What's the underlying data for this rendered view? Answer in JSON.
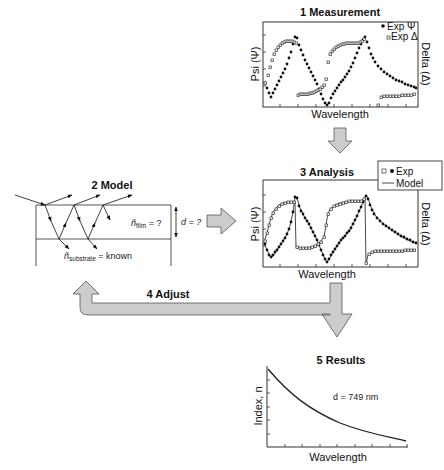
{
  "diagram": {
    "steps": [
      {
        "id": "measurement",
        "label": "1 Measurement"
      },
      {
        "id": "model",
        "label": "2 Model"
      },
      {
        "id": "analysis",
        "label": "3 Analysis"
      },
      {
        "id": "adjust",
        "label": "4 Adjust"
      },
      {
        "id": "results",
        "label": "5 Results"
      }
    ],
    "measurement": {
      "xlabel": "Wavelength",
      "ylabel_left": "Psi (Ψ)",
      "ylabel_right": "Delta (Δ)",
      "legend": [
        {
          "marker": "filled-circle",
          "label": "Exp Ψ"
        },
        {
          "marker": "open-square",
          "label": "Exp Δ"
        }
      ]
    },
    "model": {
      "film_label": "ñ",
      "film_sub": "film",
      "film_value": " = ?",
      "thickness_label": "d = ?",
      "substrate_label": "ñ",
      "substrate_sub": "substrate",
      "substrate_value": " = known"
    },
    "analysis": {
      "xlabel": "Wavelength",
      "ylabel_left": "Psi (Ψ)",
      "ylabel_right": "Delta (Δ)",
      "legend": [
        {
          "marker": "open-square+filled-circle",
          "label": "Exp"
        },
        {
          "marker": "line",
          "label": "Model"
        }
      ]
    },
    "results": {
      "xlabel": "Wavelength",
      "ylabel": "Index, n",
      "annotation": "d = 749 nm"
    },
    "colors": {
      "arrow_fill": "#cccccc",
      "arrow_stroke": "#555555",
      "line": "#111111"
    }
  }
}
